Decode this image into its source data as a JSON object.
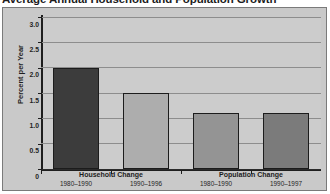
{
  "chart_data": {
    "type": "bar",
    "title": "Average Annual Household and Population Growth",
    "xlabel": "",
    "ylabel": "Percent per Year",
    "ylim": [
      0,
      3.0
    ],
    "ytick_labels": [
      "3.0",
      "2.5",
      "2.0",
      "1.5",
      "1.0",
      "0.5",
      "0"
    ],
    "ytick_values": [
      3.0,
      2.5,
      2.0,
      1.5,
      1.0,
      0.5,
      0
    ],
    "grid": true,
    "legend": "none",
    "groups": [
      {
        "label": "Household Change",
        "periods": [
          "1980–1990",
          "1990–1996"
        ]
      },
      {
        "label": "Population Change",
        "periods": [
          "1980–1990",
          "1990–1997"
        ]
      }
    ],
    "categories": [
      "1980–1990",
      "1990–1996",
      "1980–1990",
      "1990–1997"
    ],
    "values": [
      2.0,
      1.5,
      1.1,
      1.1
    ],
    "bar_colors": [
      "#3c3c3c",
      "#adadad",
      "#949494",
      "#7b7b7b"
    ]
  },
  "bars": [
    {
      "label": "1980–1990",
      "group": "Household Change",
      "value": 2.0,
      "color": "#3c3c3c"
    },
    {
      "label": "1990–1996",
      "group": "Household Change",
      "value": 1.5,
      "color": "#adadad"
    },
    {
      "label": "1980–1990",
      "group": "Population Change",
      "value": 1.1,
      "color": "#949494"
    },
    {
      "label": "1990–1997",
      "group": "Population Change",
      "value": 1.1,
      "color": "#7b7b7b"
    }
  ],
  "colors": {
    "figure_background": "#ffffff",
    "panel_background": "#cccccc",
    "frame_background": "#c9c9c9",
    "frame_border": "#7a7a7a",
    "gridline": "#8d8d8d",
    "axis": "#1e1e1e",
    "text": "#1d1d1d"
  }
}
